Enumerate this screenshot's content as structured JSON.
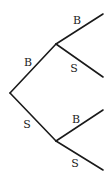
{
  "diagram": {
    "type": "tree",
    "orientation": "left-to-right",
    "colors": {
      "line": "#1a1a1a",
      "text": "#222222",
      "background": "#ffffff"
    },
    "nodes": {
      "root": {
        "x": 10,
        "y": 93
      },
      "upper": {
        "x": 56,
        "y": 44
      },
      "lower": {
        "x": 56,
        "y": 141
      },
      "upper_b_leaf": {
        "x": 103,
        "y": 14
      },
      "upper_s_leaf": {
        "x": 103,
        "y": 77
      },
      "lower_b_leaf": {
        "x": 103,
        "y": 110
      },
      "lower_s_leaf": {
        "x": 103,
        "y": 170
      }
    },
    "branches": [
      {
        "id": "root-upper",
        "label": "B",
        "from": "root",
        "to": "upper",
        "label_x": 28,
        "label_y": 62
      },
      {
        "id": "root-lower",
        "label": "S",
        "from": "root",
        "to": "lower",
        "label_x": 27,
        "label_y": 124
      },
      {
        "id": "upper-b",
        "label": "B",
        "from": "upper",
        "to": "upper_b_leaf",
        "label_x": 77,
        "label_y": 20
      },
      {
        "id": "upper-s",
        "label": "S",
        "from": "upper",
        "to": "upper_s_leaf",
        "label_x": 74,
        "label_y": 68
      },
      {
        "id": "lower-b",
        "label": "B",
        "from": "lower",
        "to": "lower_b_leaf",
        "label_x": 76,
        "label_y": 119
      },
      {
        "id": "lower-s",
        "label": "S",
        "from": "lower",
        "to": "lower_s_leaf",
        "label_x": 75,
        "label_y": 163
      }
    ]
  }
}
